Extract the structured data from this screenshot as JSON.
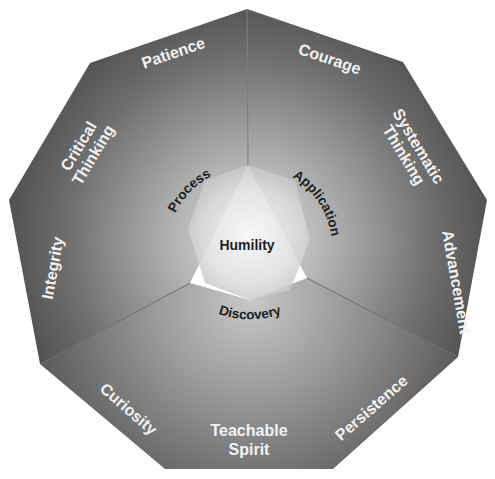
{
  "diagram": {
    "type": "nonagon-radial-diagram",
    "center": {
      "label": "Humility"
    },
    "inner_ring": [
      {
        "label": "Process"
      },
      {
        "label": "Application"
      },
      {
        "label": "Discovery"
      }
    ],
    "outer_segments": [
      {
        "label": "Patience",
        "lines": [
          "Patience"
        ]
      },
      {
        "label": "Courage",
        "lines": [
          "Courage"
        ]
      },
      {
        "label": "Systematic Thinking",
        "lines": [
          "Systematic",
          "Thinking"
        ]
      },
      {
        "label": "Advancement",
        "lines": [
          "Advancement"
        ]
      },
      {
        "label": "Persistence",
        "lines": [
          "Persistence"
        ]
      },
      {
        "label": "Teachable Spirit",
        "lines": [
          "Teachable",
          "Spirit"
        ]
      },
      {
        "label": "Curiosity",
        "lines": [
          "Curiosity"
        ]
      },
      {
        "label": "Integrity",
        "lines": [
          "Integrity"
        ]
      },
      {
        "label": "Critical Thinking",
        "lines": [
          "Critical",
          "Thinking"
        ]
      }
    ],
    "colors": {
      "edge": "#555555",
      "mid": "#8a8a8a",
      "center": "#f4f4f4",
      "outer_text": "#f2f2f2",
      "inner_text": "#1e1e1e",
      "background": "#ffffff"
    }
  }
}
